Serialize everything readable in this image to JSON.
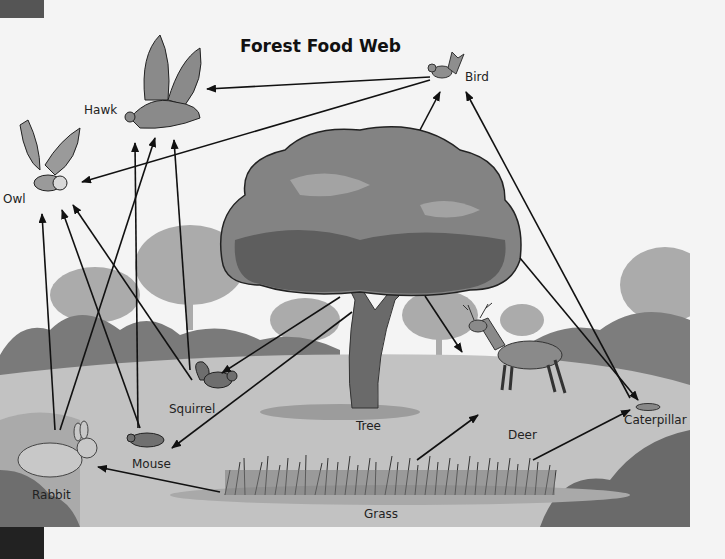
{
  "title": "Forest Food Web",
  "organisms": {
    "hawk": "Hawk",
    "bird": "Bird",
    "owl": "Owl",
    "tree": "Tree",
    "squirrel": "Squirrel",
    "mouse": "Mouse",
    "rabbit": "Rabbit",
    "deer": "Deer",
    "caterpillar": "Caterpillar",
    "grass": "Grass"
  },
  "energy_flows": [
    {
      "from": "Bird",
      "to": "Hawk"
    },
    {
      "from": "Bird",
      "to": "Owl"
    },
    {
      "from": "Tree",
      "to": "Bird"
    },
    {
      "from": "Caterpillar",
      "to": "Bird"
    },
    {
      "from": "Tree",
      "to": "Caterpillar"
    },
    {
      "from": "Tree",
      "to": "Deer"
    },
    {
      "from": "Tree",
      "to": "Squirrel"
    },
    {
      "from": "Tree",
      "to": "Mouse"
    },
    {
      "from": "Grass",
      "to": "Rabbit"
    },
    {
      "from": "Grass",
      "to": "Deer"
    },
    {
      "from": "Grass",
      "to": "Caterpillar"
    },
    {
      "from": "Rabbit",
      "to": "Owl"
    },
    {
      "from": "Rabbit",
      "to": "Hawk"
    },
    {
      "from": "Mouse",
      "to": "Owl"
    },
    {
      "from": "Mouse",
      "to": "Hawk"
    },
    {
      "from": "Squirrel",
      "to": "Owl"
    },
    {
      "from": "Squirrel",
      "to": "Hawk"
    }
  ],
  "colors": {
    "background": "#f4f4f4",
    "ground": "#bdbdbd",
    "bush_dark": "#6e6e6e",
    "bg_trees": "#a8a8a8",
    "tree_canopy": "#787878",
    "arrow": "#111111"
  }
}
